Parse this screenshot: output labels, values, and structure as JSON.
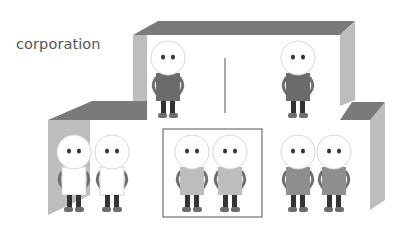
{
  "diagram": {
    "label": "corporation",
    "colors": {
      "roof": "#7a7a7a",
      "wall": "#bdbdbd",
      "outline": "#555555",
      "head_fill": "#ffffff",
      "head_stroke": "#d6d6d6",
      "eye": "#333333",
      "leg": "#333333",
      "foot": "#6e6e6e",
      "body_dark": "#6b6b6b",
      "body_white": "#ffffff",
      "body_light": "#bdbdbd",
      "body_medium": "#8e8e8e"
    },
    "groups": [
      {
        "name": "top-level",
        "figures": [
          {
            "cx": 168,
            "cy": 58,
            "body": "body_dark"
          },
          {
            "cx": 298,
            "cy": 58,
            "body": "body_dark"
          }
        ]
      },
      {
        "name": "left-department",
        "figures": [
          {
            "cx": 74,
            "cy": 152,
            "body": "body_white"
          },
          {
            "cx": 112,
            "cy": 152,
            "body": "body_white"
          }
        ]
      },
      {
        "name": "middle-department",
        "figures": [
          {
            "cx": 192,
            "cy": 152,
            "body": "body_light"
          },
          {
            "cx": 230,
            "cy": 152,
            "body": "body_light"
          }
        ]
      },
      {
        "name": "right-department",
        "figures": [
          {
            "cx": 298,
            "cy": 152,
            "body": "body_medium"
          },
          {
            "cx": 334,
            "cy": 152,
            "body": "body_medium"
          }
        ]
      }
    ]
  }
}
